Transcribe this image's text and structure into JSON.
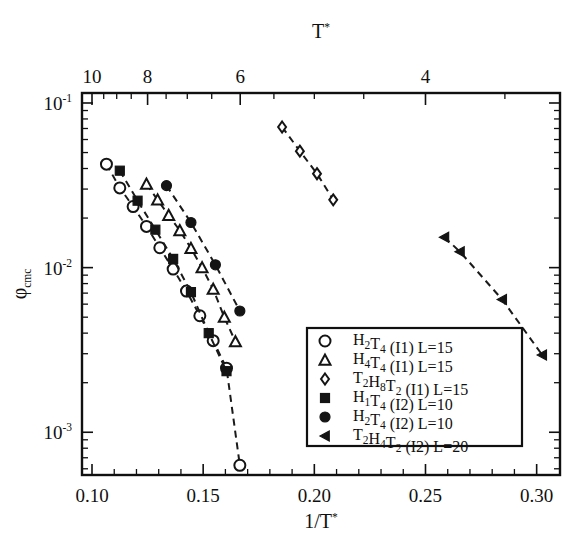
{
  "figure": {
    "background_color": "#ffffff",
    "ink_color": "#101010",
    "width": 583,
    "height": 544
  },
  "chart_data": {
    "type": "scatter",
    "title": "",
    "subtitle": "",
    "xlabel": "1/T*",
    "ylabel": "φcmc",
    "top_axis_label": "T*",
    "yscale": "log",
    "xscale": "linear",
    "xlim": [
      0.0955,
      0.3105
    ],
    "ylim": [
      0.00055,
      0.115
    ],
    "grid": false,
    "legend_position": "lower center-right",
    "x_ticks": [
      0.1,
      0.15,
      0.2,
      0.25,
      0.3
    ],
    "x_ticklabels": [
      "0.10",
      "0.15",
      "0.20",
      "0.25",
      "0.30"
    ],
    "x_minor_step": 0.01,
    "y_ticks": [
      0.1,
      0.01,
      0.001
    ],
    "y_ticklabels": [
      "10-1",
      "10-2",
      "10-3"
    ],
    "y_tick_exponents": [
      "-1",
      "-2",
      "-3"
    ],
    "top_ticks": [
      10,
      8,
      6,
      4
    ],
    "top_ticklabels": [
      "10",
      "8",
      "6",
      "4"
    ],
    "top_minor_ticks": [
      9.5,
      9,
      8.5,
      7.5,
      7,
      6.5,
      5.5,
      5,
      4.5,
      3.5
    ],
    "series": [
      {
        "name": "H2T4 (I1) L=15",
        "legend_label_parts": [
          {
            "t": "H",
            "s": "n"
          },
          {
            "t": "2",
            "s": "sub"
          },
          {
            "t": "T",
            "s": "n"
          },
          {
            "t": "4",
            "s": "sub"
          },
          {
            "t": " (I1) L=15",
            "s": "n"
          }
        ],
        "marker": "circle-open",
        "marker_size": 11,
        "line": "dashed",
        "x": [
          0.1065,
          0.1125,
          0.1185,
          0.1245,
          0.1305,
          0.1365,
          0.1425,
          0.1485,
          0.1545,
          0.1605,
          0.1665
        ],
        "y": [
          0.0425,
          0.0305,
          0.0235,
          0.0178,
          0.0132,
          0.0098,
          0.0072,
          0.0051,
          0.0036,
          0.00245,
          0.00063
        ]
      },
      {
        "name": "H4T4 (I1) L=15",
        "legend_label_parts": [
          {
            "t": "H",
            "s": "n"
          },
          {
            "t": "4",
            "s": "sub"
          },
          {
            "t": "T",
            "s": "n"
          },
          {
            "t": "4",
            "s": "sub"
          },
          {
            "t": " (I1) L=15",
            "s": "n"
          }
        ],
        "marker": "triangle-open",
        "marker_size": 11,
        "line": "dashed",
        "x": [
          0.1245,
          0.1295,
          0.1345,
          0.1395,
          0.1445,
          0.1495,
          0.1545,
          0.1595,
          0.1645
        ],
        "y": [
          0.0322,
          0.0258,
          0.0208,
          0.0168,
          0.0131,
          0.01,
          0.0074,
          0.005,
          0.00355
        ]
      },
      {
        "name": "T2H8T2 (I1) L=15",
        "legend_label_parts": [
          {
            "t": "T",
            "s": "n"
          },
          {
            "t": "2",
            "s": "sub"
          },
          {
            "t": "H",
            "s": "n"
          },
          {
            "t": "8",
            "s": "sub"
          },
          {
            "t": "T",
            "s": "n"
          },
          {
            "t": "2",
            "s": "sub"
          },
          {
            "t": " (I1) L=15",
            "s": "n"
          }
        ],
        "marker": "diamond-open",
        "marker_size": 11,
        "line": "dashed",
        "x": [
          0.1855,
          0.1935,
          0.2012,
          0.2085
        ],
        "y": [
          0.0715,
          0.051,
          0.0372,
          0.0258
        ]
      },
      {
        "name": "H1T4 (I2) L=10",
        "legend_label_parts": [
          {
            "t": "H",
            "s": "n"
          },
          {
            "t": "1",
            "s": "sub"
          },
          {
            "t": "T",
            "s": "n"
          },
          {
            "t": "4",
            "s": "sub"
          },
          {
            "t": " (I2) L=10",
            "s": "n"
          }
        ],
        "marker": "square-filled",
        "marker_size": 9,
        "line": "dashed",
        "x": [
          0.1125,
          0.1205,
          0.1285,
          0.1365,
          0.1445,
          0.1525,
          0.1605
        ],
        "y": [
          0.0388,
          0.0255,
          0.017,
          0.0113,
          0.0071,
          0.004,
          0.00235
        ]
      },
      {
        "name": "H2T4 (I2) L=10",
        "legend_label_parts": [
          {
            "t": "H",
            "s": "n"
          },
          {
            "t": "2",
            "s": "sub"
          },
          {
            "t": "T",
            "s": "n"
          },
          {
            "t": "4",
            "s": "sub"
          },
          {
            "t": " (I2) L=10",
            "s": "n"
          }
        ],
        "marker": "circle-filled",
        "marker_size": 10,
        "line": "dashed",
        "x": [
          0.1335,
          0.1445,
          0.1555,
          0.1665
        ],
        "y": [
          0.0315,
          0.0188,
          0.0104,
          0.00545
        ]
      },
      {
        "name": "T2H4T2 (I2) L=20",
        "legend_label_parts": [
          {
            "t": "T",
            "s": "n"
          },
          {
            "t": "2",
            "s": "sub"
          },
          {
            "t": "H",
            "s": "n"
          },
          {
            "t": "4",
            "s": "sub"
          },
          {
            "t": "T",
            "s": "n"
          },
          {
            "t": "2",
            "s": "sub"
          },
          {
            "t": " (I2) L=20",
            "s": "n"
          }
        ],
        "marker": "triangle-left-filled",
        "marker_size": 10,
        "line": "dashed",
        "x": [
          0.2585,
          0.2655,
          0.2845,
          0.3025
        ],
        "y": [
          0.0153,
          0.0125,
          0.0064,
          0.00295
        ]
      }
    ]
  },
  "legend": {
    "entries": [
      {
        "marker": "circle-open",
        "label": "H2T4 (I1) L=15"
      },
      {
        "marker": "triangle-open",
        "label": "H4T4 (I1) L=15"
      },
      {
        "marker": "diamond-open",
        "label": "T2H8T2 (I1) L=15"
      },
      {
        "marker": "square-filled",
        "label": "H1T4 (I2) L=10"
      },
      {
        "marker": "circle-filled",
        "label": "H2T4 (I2) L=10"
      },
      {
        "marker": "triangle-left-filled",
        "label": "T2H4T2 (I2) L=20"
      }
    ]
  }
}
